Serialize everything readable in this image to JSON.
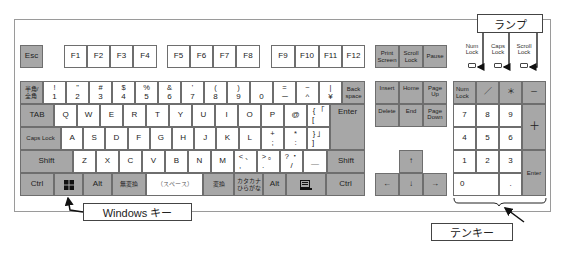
{
  "function_row": {
    "esc": "Esc",
    "f_keys": [
      "F1",
      "F2",
      "F3",
      "F4",
      "F5",
      "F6",
      "F7",
      "F8",
      "F9",
      "F10",
      "F11",
      "F12"
    ]
  },
  "number_row": {
    "hankaku": [
      "半角/",
      "全角"
    ],
    "keys": [
      {
        "top": "!",
        "bottom": "1"
      },
      {
        "top": "\"",
        "bottom": "2"
      },
      {
        "top": "#",
        "bottom": "3"
      },
      {
        "top": "$",
        "bottom": "4"
      },
      {
        "top": "%",
        "bottom": "5"
      },
      {
        "top": "&",
        "bottom": "6"
      },
      {
        "top": "'",
        "bottom": "7"
      },
      {
        "top": "(",
        "bottom": "8"
      },
      {
        "top": ")",
        "bottom": "9"
      },
      {
        "top": "",
        "bottom": "0"
      },
      {
        "top": "=",
        "bottom": "－"
      },
      {
        "top": "~",
        "bottom": "^"
      },
      {
        "top": "|",
        "bottom": "¥"
      }
    ],
    "backspace": [
      "Back",
      "space"
    ]
  },
  "qwerty_row": {
    "tab": "TAB",
    "keys": [
      "Q",
      "W",
      "E",
      "R",
      "T",
      "Y",
      "U",
      "I",
      "O",
      "P",
      "@"
    ],
    "bracket": {
      "top": "{ 「",
      "bottom": "["
    },
    "enter": "Enter"
  },
  "home_row": {
    "caps": "Caps Lock",
    "keys": [
      "A",
      "S",
      "D",
      "F",
      "G",
      "H",
      "J",
      "K",
      "L"
    ],
    "plus": {
      "top": "+",
      "bottom": ";"
    },
    "star": {
      "top": "*",
      "bottom": ":"
    },
    "close_bracket": {
      "top": "} 」",
      "bottom": "]"
    }
  },
  "shift_row": {
    "shift_left": "Shift",
    "keys": [
      "Z",
      "X",
      "C",
      "V",
      "B",
      "N",
      "M"
    ],
    "comma": {
      "top": "< 、",
      "bottom": ","
    },
    "period": {
      "top": "> 。",
      "bottom": "."
    },
    "slash": {
      "top": "? ・",
      "bottom": "/"
    },
    "underscore": "＿",
    "shift_right": "Shift"
  },
  "bottom_row": {
    "ctrl_left": "Ctrl",
    "windows_icon": "windows-icon",
    "alt_left": "Alt",
    "muhenkan": "無変換",
    "space": "（スペース）",
    "henkan": "変換",
    "kana": [
      "カタカナ",
      "ひらがな"
    ],
    "alt_right": "Alt",
    "menu_icon": "menu-icon",
    "ctrl_right": "Ctrl"
  },
  "system_keys": {
    "print_screen": [
      "Print",
      "Screen"
    ],
    "scroll_lock": [
      "Scroll",
      "Lock"
    ],
    "pause": "Pause"
  },
  "nav_keys": {
    "insert": "Insert",
    "home": "Home",
    "page_up": [
      "Page",
      "Up"
    ],
    "delete": "Delete",
    "end": "End",
    "page_down": [
      "Page",
      "Down"
    ]
  },
  "arrow_keys": {
    "up": "↑",
    "left": "←",
    "down": "↓",
    "right": "→"
  },
  "numpad": {
    "num_lock": [
      "Num",
      "Lock"
    ],
    "divide": "／",
    "multiply": "＊",
    "minus": "－",
    "plus": "＋",
    "enter": "Enter",
    "digits": [
      "7",
      "8",
      "9",
      "4",
      "5",
      "6",
      "1",
      "2",
      "3"
    ],
    "zero": "0",
    "decimal": "."
  },
  "lamps": {
    "num_lock": [
      "Num",
      "Lock"
    ],
    "caps_lock": [
      "Caps",
      "Lock"
    ],
    "scroll_lock": [
      "Scroll",
      "Lock"
    ]
  },
  "callouts": {
    "lamp": "ランプ",
    "windows_key": "Windows キー",
    "tenkey": "テンキー"
  }
}
